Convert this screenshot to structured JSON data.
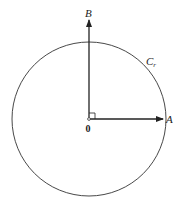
{
  "diagram": {
    "circle": {
      "label": "C",
      "label_sub": "r",
      "cx": 89,
      "cy": 119,
      "r": 77
    },
    "origin": {
      "label": "0",
      "x": 89,
      "y": 119
    },
    "vectors": [
      {
        "id": "A",
        "label": "A",
        "direction": "right"
      },
      {
        "id": "B",
        "label": "B",
        "direction": "up"
      }
    ],
    "right_angle_marker": true,
    "colors": {
      "stroke": "#222222",
      "background": "#ffffff"
    }
  }
}
